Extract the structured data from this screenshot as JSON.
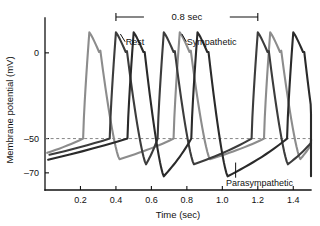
{
  "chart_data": {
    "type": "line",
    "title": "",
    "xlabel": "Time (sec)",
    "ylabel": "Membrane potential (mV)",
    "xlim": [
      0.0,
      1.5
    ],
    "ylim": [
      -80,
      18
    ],
    "xticks": [
      "0.2",
      "0.4",
      "0.6",
      "0.8",
      "1.0",
      "1.2",
      "1.4"
    ],
    "xtick_values": [
      0.2,
      0.4,
      0.6,
      0.8,
      1.0,
      1.2,
      1.4
    ],
    "yticks": [
      "0",
      "-50",
      "-70"
    ],
    "ytick_values": [
      0,
      -50,
      -70
    ],
    "grid": false,
    "legend_position": "inline-annotations",
    "threshold_line": {
      "value": -50,
      "style": "dashed",
      "color": "#777777"
    },
    "interval_bracket": {
      "label": "0.8 sec",
      "x_start": 0.4,
      "x_end": 1.2
    },
    "series": [
      {
        "name": "Sympathetic",
        "color": "#8c8c8c",
        "cycle_period": 0.52,
        "resting_potential": -62,
        "peak_potential": 12,
        "threshold": -50,
        "peak_times": [
          0.25,
          0.76,
          1.27
        ],
        "annotation": "Sympathetic"
      },
      {
        "name": "Rest",
        "color": "#3c3c3c",
        "cycle_period": 0.8,
        "resting_potential": -65,
        "peak_potential": 12,
        "threshold": -50,
        "peak_times": [
          0.4,
          0.67,
          1.2
        ],
        "annotation": "Rest"
      },
      {
        "name": "Parasympathetic",
        "color": "#2a2a2a",
        "cycle_period": 1.1,
        "resting_potential": -72,
        "peak_potential": 12,
        "threshold": -50,
        "peak_times": [
          0.5,
          0.86,
          1.4
        ],
        "annotation": "Parasympathetic"
      }
    ],
    "annotations": [
      {
        "text": "Rest",
        "x": 0.46,
        "y": 8
      },
      {
        "text": "Sympathetic",
        "x": 0.8,
        "y": 8
      },
      {
        "text": "Parasympathetic",
        "x": 1.05,
        "y": -76
      },
      {
        "text": "0.8 sec",
        "x": 0.8,
        "y": 17
      }
    ]
  },
  "axes": {
    "x_title": "Time (sec)",
    "y_title": "Membrane potential (mV)",
    "x_tick_0": "0.2",
    "x_tick_1": "0.4",
    "x_tick_2": "0.6",
    "x_tick_3": "0.8",
    "x_tick_4": "1.0",
    "x_tick_5": "1.2",
    "x_tick_6": "1.4",
    "y_tick_0": "0",
    "y_tick_1": "-50",
    "y_tick_2": "-70"
  },
  "labels": {
    "rest": "Rest",
    "sympathetic": "Sympathetic",
    "parasympathetic": "Parasympathetic",
    "bracket": "0.8 sec"
  }
}
